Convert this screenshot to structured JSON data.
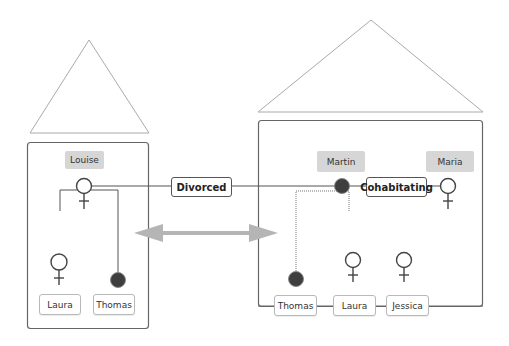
{
  "households": [
    {
      "id": "left",
      "parent": {
        "name": "Louise",
        "gender": "female-icon"
      },
      "children": [
        {
          "name": "Laura",
          "gender": "female-icon"
        },
        {
          "name": "Thomas",
          "gender": "male-filled-circle-icon"
        }
      ]
    },
    {
      "id": "right",
      "parents": [
        {
          "name": "Martin",
          "gender": "male-filled-circle-icon"
        },
        {
          "name": "Maria",
          "gender": "female-icon"
        }
      ],
      "children": [
        {
          "name": "Thomas",
          "gender": "male-filled-circle-icon"
        },
        {
          "name": "Laura",
          "gender": "female-icon"
        },
        {
          "name": "Jessica",
          "gender": "female-icon"
        }
      ]
    }
  ],
  "relationships": {
    "divorced": "Divorced",
    "cohabitating": "Cohabitating"
  },
  "arrow": {
    "type": "double-headed-arrow",
    "color": "#b5b5b5"
  },
  "colors": {
    "line": "#555555",
    "name_bg": "#d6d6d6",
    "male_fill": "#3e3e3e"
  }
}
